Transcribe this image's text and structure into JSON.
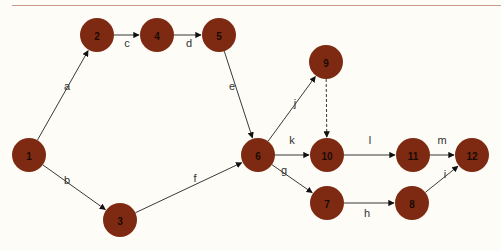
{
  "diagram": {
    "type": "activity-network",
    "node_color": "#7e2a12",
    "nodes": [
      {
        "id": "1",
        "x": 29,
        "y": 155
      },
      {
        "id": "2",
        "x": 97,
        "y": 35
      },
      {
        "id": "4",
        "x": 157,
        "y": 35
      },
      {
        "id": "5",
        "x": 219,
        "y": 35
      },
      {
        "id": "3",
        "x": 120,
        "y": 220
      },
      {
        "id": "6",
        "x": 258,
        "y": 155
      },
      {
        "id": "9",
        "x": 326,
        "y": 62
      },
      {
        "id": "10",
        "x": 327,
        "y": 155
      },
      {
        "id": "11",
        "x": 413,
        "y": 155
      },
      {
        "id": "12",
        "x": 472,
        "y": 155
      },
      {
        "id": "7",
        "x": 327,
        "y": 203
      },
      {
        "id": "8",
        "x": 412,
        "y": 203
      }
    ],
    "edges": [
      {
        "from": "1",
        "to": "2",
        "label": "a",
        "lx": 67,
        "ly": 86,
        "dashed": false
      },
      {
        "from": "1",
        "to": "3",
        "label": "b",
        "lx": 67,
        "ly": 180,
        "dashed": false
      },
      {
        "from": "2",
        "to": "4",
        "label": "c",
        "lx": 127,
        "ly": 43,
        "dashed": false
      },
      {
        "from": "4",
        "to": "5",
        "label": "d",
        "lx": 189,
        "ly": 43,
        "dashed": false
      },
      {
        "from": "5",
        "to": "6",
        "label": "e",
        "lx": 232,
        "ly": 86,
        "dashed": false
      },
      {
        "from": "3",
        "to": "6",
        "label": "f",
        "lx": 195,
        "ly": 178,
        "dashed": false
      },
      {
        "from": "6",
        "to": "7",
        "label": "g",
        "lx": 284,
        "ly": 170,
        "dashed": false
      },
      {
        "from": "7",
        "to": "8",
        "label": "h",
        "lx": 367,
        "ly": 213,
        "dashed": false
      },
      {
        "from": "8",
        "to": "12",
        "label": "i",
        "lx": 445,
        "ly": 174,
        "dashed": false
      },
      {
        "from": "6",
        "to": "9",
        "label": "j",
        "lx": 295,
        "ly": 103,
        "dashed": false
      },
      {
        "from": "6",
        "to": "10",
        "label": "k",
        "lx": 292,
        "ly": 140,
        "dashed": false
      },
      {
        "from": "9",
        "to": "10",
        "label": "",
        "lx": 0,
        "ly": 0,
        "dashed": true
      },
      {
        "from": "10",
        "to": "11",
        "label": "l",
        "lx": 370,
        "ly": 140,
        "dashed": false
      },
      {
        "from": "11",
        "to": "12",
        "label": "m",
        "lx": 442,
        "ly": 140,
        "dashed": false
      }
    ]
  }
}
